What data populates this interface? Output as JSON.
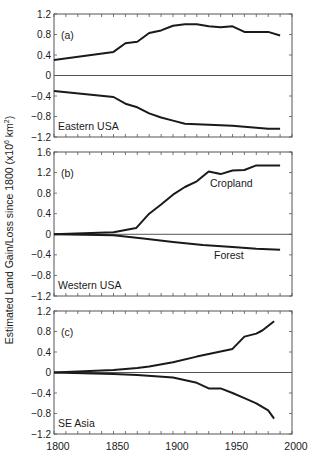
{
  "figure": {
    "ylabel": "Estimated Land Gain/Loss since 1800 (x10",
    "ylabel_sup": "6",
    "ylabel_unit": " km",
    "ylabel_unit_sup": "2",
    "ylabel_close": ")",
    "xticks": [
      1800,
      1850,
      1900,
      1950,
      2000
    ],
    "line_color": "#1a1a1a",
    "axis_color": "#555555"
  },
  "chart_data": [
    {
      "type": "line",
      "panel": "(a)",
      "region": "Eastern USA",
      "xlabel": "",
      "ylabel": "Estimated Land Gain/Loss since 1800 (x10^6 km^2)",
      "xlim": [
        1800,
        2000
      ],
      "ylim": [
        -1.2,
        1.2
      ],
      "yticks": [
        "1.2",
        "0.8",
        "0.4",
        "0",
        "−0.4",
        "−0.8",
        "−1.2"
      ],
      "series": [
        {
          "name": "Cropland",
          "x": [
            1800,
            1850,
            1860,
            1870,
            1880,
            1890,
            1900,
            1910,
            1920,
            1930,
            1940,
            1950,
            1960,
            1970,
            1980,
            1990
          ],
          "values": [
            0.3,
            0.46,
            0.63,
            0.66,
            0.83,
            0.88,
            0.97,
            1.0,
            1.0,
            0.96,
            0.94,
            0.96,
            0.85,
            0.85,
            0.85,
            0.78
          ]
        },
        {
          "name": "Forest",
          "x": [
            1800,
            1850,
            1860,
            1870,
            1880,
            1890,
            1900,
            1910,
            1920,
            1930,
            1940,
            1950,
            1960,
            1970,
            1980,
            1990
          ],
          "values": [
            -0.3,
            -0.42,
            -0.55,
            -0.62,
            -0.74,
            -0.82,
            -0.88,
            -0.94,
            -0.95,
            -0.96,
            -0.97,
            -0.98,
            -1.0,
            -1.02,
            -1.04,
            -1.04
          ]
        }
      ]
    },
    {
      "type": "line",
      "panel": "(b)",
      "region": "Western USA",
      "xlabel": "",
      "ylabel": "Estimated Land Gain/Loss since 1800 (x10^6 km^2)",
      "xlim": [
        1800,
        2000
      ],
      "ylim": [
        -1.2,
        1.6
      ],
      "yticks": [
        "1.6",
        "1.2",
        "0.8",
        "0.4",
        "0",
        "−0.4",
        "−0.8",
        "−1.2"
      ],
      "annotations": [
        "Cropland",
        "Forest"
      ],
      "series": [
        {
          "name": "Cropland",
          "x": [
            1800,
            1850,
            1869,
            1880,
            1890,
            1900,
            1910,
            1920,
            1930,
            1940,
            1950,
            1960,
            1970,
            1980,
            1990
          ],
          "values": [
            0.0,
            0.04,
            0.12,
            0.4,
            0.58,
            0.77,
            0.92,
            1.03,
            1.22,
            1.17,
            1.24,
            1.25,
            1.34,
            1.34,
            1.34
          ]
        },
        {
          "name": "Forest",
          "x": [
            1800,
            1850,
            1875,
            1900,
            1925,
            1950,
            1970,
            1990
          ],
          "values": [
            0.0,
            -0.02,
            -0.08,
            -0.15,
            -0.21,
            -0.25,
            -0.28,
            -0.3
          ]
        }
      ]
    },
    {
      "type": "line",
      "panel": "(c)",
      "region": "SE Asia",
      "xlabel": "",
      "ylabel": "Estimated Land Gain/Loss since 1800 (x10^6 km^2)",
      "xlim": [
        1800,
        2000
      ],
      "ylim": [
        -1.2,
        1.2
      ],
      "yticks": [
        "1.2",
        "0.8",
        "0.4",
        "0",
        "−0.4",
        "−0.8",
        "−1.2"
      ],
      "xticks": [
        "1800",
        "1850",
        "1900",
        "1950",
        "2000"
      ],
      "series": [
        {
          "name": "Cropland",
          "x": [
            1800,
            1850,
            1870,
            1880,
            1900,
            1920,
            1940,
            1950,
            1960,
            1970,
            1975,
            1985
          ],
          "values": [
            0.0,
            0.05,
            0.09,
            0.12,
            0.2,
            0.31,
            0.41,
            0.46,
            0.7,
            0.76,
            0.82,
            1.0
          ]
        },
        {
          "name": "Forest",
          "x": [
            1800,
            1850,
            1870,
            1900,
            1920,
            1930,
            1940,
            1950,
            1960,
            1970,
            1980,
            1985
          ],
          "values": [
            0.0,
            -0.03,
            -0.05,
            -0.1,
            -0.2,
            -0.31,
            -0.31,
            -0.4,
            -0.5,
            -0.6,
            -0.74,
            -0.9
          ]
        }
      ]
    }
  ]
}
